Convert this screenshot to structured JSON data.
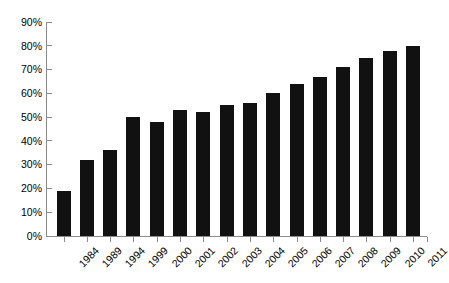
{
  "chart_data": {
    "type": "bar",
    "title": "",
    "xlabel": "",
    "ylabel": "",
    "categories": [
      "1984",
      "1989",
      "1994",
      "1999",
      "2000",
      "2001",
      "2002",
      "2003",
      "2004",
      "2005",
      "2006",
      "2007",
      "2008",
      "2009",
      "2010",
      "2011"
    ],
    "values": [
      19,
      32,
      36,
      50,
      48,
      53,
      52,
      55,
      56,
      60,
      64,
      67,
      71,
      75,
      78,
      80
    ],
    "value_suffix": "%",
    "ylim": [
      0,
      90
    ],
    "ytick_step": 10,
    "ytick_labels": [
      "0%",
      "10%",
      "20%",
      "30%",
      "40%",
      "50%",
      "60%",
      "70%",
      "80%",
      "90%"
    ],
    "grid": false,
    "legend": false,
    "bar_color": "#111111",
    "axis_color": "#8a8a8a",
    "text_color": "#000000",
    "background": "#ffffff",
    "xtick_rotation": -45
  }
}
